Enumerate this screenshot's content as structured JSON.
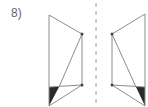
{
  "problem": {
    "number_label": "8)"
  },
  "colors": {
    "stroke": "#8c8c8c",
    "fill_dark": "#2b2b2b",
    "axis": "#9a9a9a",
    "label": "#666666"
  },
  "figure": {
    "axis_of_symmetry": {
      "x": 96,
      "y1": 3,
      "y2": 105,
      "dash": "4 4"
    },
    "left_shape": {
      "outline": [
        [
          49,
          15
        ],
        [
          82,
          34
        ],
        [
          82,
          85
        ],
        [
          49,
          106
        ]
      ],
      "diagonal": [
        [
          82,
          34
        ],
        [
          59,
          87
        ]
      ],
      "horizontal": [
        [
          49,
          87
        ],
        [
          82,
          85
        ]
      ],
      "lower_diagonal": [
        [
          82,
          85
        ],
        [
          49,
          106
        ]
      ],
      "shaded_triangle": [
        [
          49,
          87
        ],
        [
          59,
          87
        ],
        [
          49,
          106
        ]
      ],
      "dots": [
        [
          82,
          34
        ],
        [
          82,
          85
        ]
      ]
    },
    "right_shape": {
      "outline": [
        [
          145,
          14
        ],
        [
          112,
          34
        ],
        [
          112,
          85
        ],
        [
          145,
          106
        ]
      ],
      "diagonal": [
        [
          112,
          34
        ],
        [
          136,
          87
        ]
      ],
      "horizontal": [
        [
          112,
          85
        ],
        [
          145,
          87
        ]
      ],
      "lower_diagonal": [
        [
          112,
          85
        ],
        [
          145,
          106
        ]
      ],
      "shaded_triangle": [
        [
          136,
          87
        ],
        [
          145,
          87
        ],
        [
          145,
          106
        ]
      ],
      "dots": [
        [
          112,
          34
        ],
        [
          112,
          85
        ]
      ]
    }
  }
}
